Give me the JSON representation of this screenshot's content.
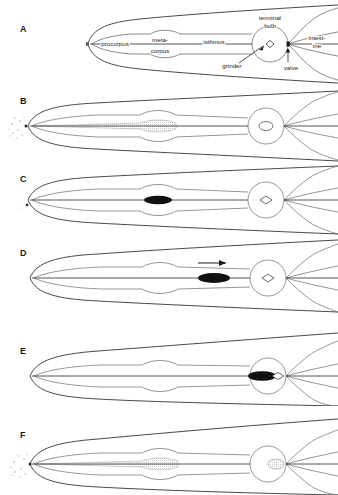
{
  "figure": {
    "width": 338,
    "height": 495,
    "background": "#ffffff",
    "line_color": "#3c3c3c",
    "outline_color": "#1a1a1a",
    "bolus_color": "#111111",
    "stipple_color": "#9a9a9a"
  },
  "panels": [
    {
      "letter": "A",
      "name": "anatomy-labels",
      "caption": "",
      "has_labels": true,
      "bolus": "none",
      "stipple": "none",
      "arrow": false
    },
    {
      "letter": "B",
      "name": "ingestion-suspension",
      "caption": "",
      "has_labels": false,
      "bolus": "none",
      "stipple": "lumen-and-mouth",
      "arrow": false
    },
    {
      "letter": "C",
      "name": "bolus-in-metacorpus",
      "caption": "",
      "has_labels": false,
      "bolus": "metacorpus",
      "stipple": "mouth-speck",
      "arrow": false
    },
    {
      "letter": "D",
      "name": "bolus-in-isthmus",
      "caption": "",
      "has_labels": false,
      "bolus": "isthmus",
      "stipple": "none",
      "arrow": true
    },
    {
      "letter": "E",
      "name": "bolus-at-grinder",
      "caption": "",
      "has_labels": false,
      "bolus": "terminal-bulb",
      "stipple": "none",
      "arrow": false
    },
    {
      "letter": "F",
      "name": "refilling-lumen",
      "caption": "",
      "has_labels": false,
      "bolus": "none",
      "stipple": "lumen-mouth-and-bulb",
      "arrow": false
    }
  ],
  "labels": {
    "procorpus": "procorpus",
    "metacorpus_line1": "meta-",
    "metacorpus_line2": "corpus",
    "isthmus": "isthmus",
    "terminal_bulb_line1": "terminal",
    "terminal_bulb_line2": "bulb",
    "grinder": "grinder",
    "valve": "valve",
    "intestine_line1": "intest-",
    "intestine_line2": "ine"
  }
}
